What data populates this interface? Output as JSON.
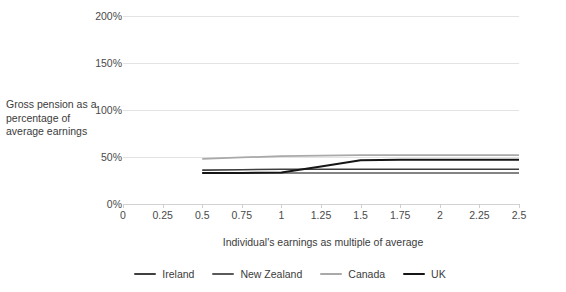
{
  "chart_data": {
    "type": "line",
    "title": "",
    "xlabel": "Individual's earnings as multiple of average",
    "ylabel": "Gross pension as a percentage of average earnings",
    "xlim": [
      0,
      2.5
    ],
    "ylim": [
      0,
      200
    ],
    "grid": true,
    "legend_position": "bottom",
    "x_ticks": [
      "0",
      "0.25",
      "0.5",
      "0.75",
      "1",
      "1.25",
      "1.5",
      "1.75",
      "2",
      "2.25",
      "2.5"
    ],
    "x_tick_values": [
      0,
      0.25,
      0.5,
      0.75,
      1,
      1.25,
      1.5,
      1.75,
      2,
      2.25,
      2.5
    ],
    "y_ticks": [
      "0%",
      "50%",
      "100%",
      "150%",
      "200%"
    ],
    "y_tick_values": [
      0,
      50,
      100,
      150,
      200
    ],
    "x": [
      0.5,
      0.75,
      1,
      1.25,
      1.5,
      1.75,
      2,
      2.25,
      2.5
    ],
    "series": [
      {
        "name": "Ireland",
        "color": "#3f3f3f",
        "width": 1.6,
        "values": [
          36,
          36.5,
          37,
          37,
          37,
          37,
          37,
          37,
          37
        ]
      },
      {
        "name": "New Zealand",
        "color": "#5a5a5a",
        "width": 1.6,
        "values": [
          33,
          33,
          33,
          33,
          33,
          33,
          33,
          33,
          33
        ]
      },
      {
        "name": "Canada",
        "color": "#a9a9a9",
        "width": 1.8,
        "values": [
          48,
          49.5,
          51,
          51.5,
          52,
          52,
          52,
          52,
          52
        ]
      },
      {
        "name": "UK",
        "color": "#161616",
        "width": 2.0,
        "values": [
          33,
          33,
          33.5,
          40,
          46.5,
          47,
          47,
          47,
          47
        ]
      }
    ]
  },
  "legend": {
    "items": [
      {
        "label": "Ireland",
        "color": "#3f3f3f"
      },
      {
        "label": "New Zealand",
        "color": "#5a5a5a"
      },
      {
        "label": "Canada",
        "color": "#a9a9a9"
      },
      {
        "label": "UK",
        "color": "#161616"
      }
    ]
  }
}
